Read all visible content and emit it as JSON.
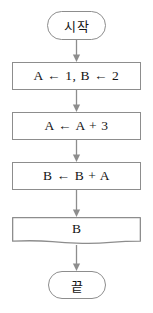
{
  "diagram": {
    "colors": {
      "stroke": "#8d8d8d",
      "text": "#141414",
      "background": "#ffffff",
      "connector": "#8d8d8d"
    },
    "nodes": [
      {
        "id": "start",
        "shape": "terminator",
        "label": "시작"
      },
      {
        "id": "init",
        "shape": "process",
        "label": "A ← 1, B ← 2"
      },
      {
        "id": "step_a",
        "shape": "process",
        "label": "A ← A + 3"
      },
      {
        "id": "step_b",
        "shape": "process",
        "label": "B ← B + A"
      },
      {
        "id": "output",
        "shape": "document",
        "label": "B"
      },
      {
        "id": "end",
        "shape": "terminator",
        "label": "끝"
      }
    ],
    "connectors": [
      {
        "id": "start-to-init",
        "from": "start",
        "to": "init",
        "arrow": "down"
      },
      {
        "id": "init-to-step-a",
        "from": "init",
        "to": "step_a",
        "arrow": "down"
      },
      {
        "id": "step-a-to-step-b",
        "from": "step_a",
        "to": "step_b",
        "arrow": "down"
      },
      {
        "id": "step-b-to-output",
        "from": "step_b",
        "to": "output",
        "arrow": "down"
      },
      {
        "id": "output-to-end",
        "from": "output",
        "to": "end",
        "arrow": "down"
      }
    ]
  }
}
